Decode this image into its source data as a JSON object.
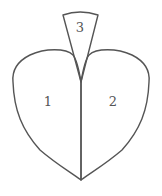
{
  "diagram": {
    "stroke_color": "#555555",
    "background": "#ffffff",
    "regions": [
      {
        "id": "1",
        "label": "1",
        "position": "left lobe"
      },
      {
        "id": "2",
        "label": "2",
        "position": "right lobe"
      },
      {
        "id": "3",
        "label": "3",
        "position": "top wedge"
      }
    ]
  }
}
